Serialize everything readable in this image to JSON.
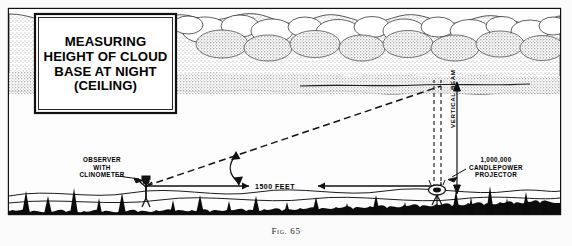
{
  "figure": {
    "caption_prefix": "Fig.",
    "caption_number": "65",
    "title_lines": [
      "Measuring",
      "Height of Cloud",
      "Base at Night",
      "(Ceiling)"
    ]
  },
  "labels": {
    "observer": "OBSERVER\nWITH\nCLINOMETER",
    "observer_line1": "OBSERVER",
    "observer_line2": "WITH",
    "observer_line3": "CLINOMETER",
    "projector_line1": "1,000,000",
    "projector_line2": "CANDLEPOWER",
    "projector_line3": "PROJECTOR",
    "baseline_distance": "1500 FEET",
    "vertical_beam": "VERTICAL BEAM",
    "angle_symbol": "θ"
  },
  "scene": {
    "observer_name": "observer-figure",
    "projector_name": "projector-figure",
    "cloud_name": "cloud-bank",
    "ground_name": "ground-horizon",
    "sight_line_name": "dashed-sight-line",
    "beam_name": "vertical-light-beam",
    "height_measure_name": "cloud-height-measure"
  },
  "colors": {
    "paper": "#fbfbfb",
    "ink": "#111111",
    "cloud_fill": "#ffffff",
    "cloud_stipple": "#3a3a3a",
    "ground_dark": "#0d0d0d"
  }
}
